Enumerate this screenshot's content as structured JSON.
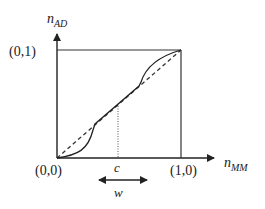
{
  "diagram": {
    "y_axis": {
      "label": "n",
      "subscript": "AD"
    },
    "x_axis": {
      "label": "n",
      "subscript": "MM"
    },
    "points": {
      "origin": "(0,0)",
      "top_left": "(0,1)",
      "bottom_right": "(1,0)"
    },
    "center_marker": "c",
    "width_marker": "w",
    "colors": {
      "line": "#222222",
      "dashed": "#333333",
      "dotted": "#555555"
    }
  }
}
